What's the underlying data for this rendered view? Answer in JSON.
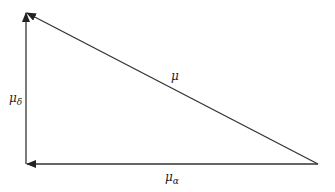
{
  "diagram": {
    "type": "vector-triangle",
    "vertices": {
      "top_left": {
        "x": 26,
        "y": 12
      },
      "bottom_left": {
        "x": 26,
        "y": 164
      },
      "right": {
        "x": 318,
        "y": 164
      }
    },
    "vectors": [
      {
        "name": "mu",
        "symbol": "μ",
        "subscript": "",
        "from": "right",
        "to": "top_left"
      },
      {
        "name": "mu_alpha",
        "symbol": "μ",
        "subscript": "α",
        "from": "right",
        "to": "bottom_left"
      },
      {
        "name": "mu_delta",
        "symbol": "μ",
        "subscript": "δ",
        "from": "bottom_left",
        "to": "top_left"
      }
    ],
    "labels": {
      "mu": {
        "symbol": "μ",
        "subscript": ""
      },
      "mu_alpha": {
        "symbol": "μ",
        "subscript": "α"
      },
      "mu_delta": {
        "symbol": "μ",
        "subscript": "δ"
      }
    },
    "line_color": "#222222",
    "background": "#ffffff"
  }
}
